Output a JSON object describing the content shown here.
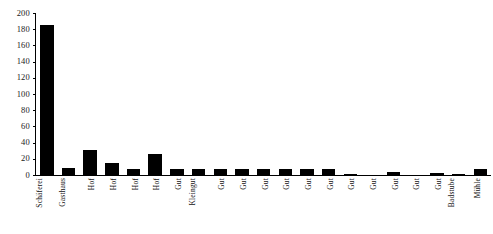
{
  "chart_data": {
    "type": "bar",
    "title": "",
    "subtitle": "",
    "xlabel": "",
    "ylabel": "",
    "ylim": [
      0,
      200
    ],
    "y_ticks": [
      0,
      20,
      40,
      60,
      80,
      100,
      120,
      140,
      160,
      180,
      200
    ],
    "grid": false,
    "legend": null,
    "bar_color": "#000000",
    "axis_color": "#000000",
    "categories": [
      "Schäferei",
      "Gasthaus",
      "Hof",
      "Hof",
      "Hof",
      "Hof",
      "Gut",
      "Kleingut",
      "Gut",
      "Gut",
      "Gut",
      "Gut",
      "Gut",
      "Gut",
      "Gut",
      "Gut",
      "Gut",
      "Gut",
      "Gut",
      "Badstube",
      "Mühle"
    ],
    "values": [
      185,
      9,
      31,
      15,
      7,
      26,
      8,
      8,
      8,
      8,
      8,
      8,
      8,
      8,
      1.5,
      0,
      3.5,
      0,
      3,
      1.5,
      7
    ]
  }
}
